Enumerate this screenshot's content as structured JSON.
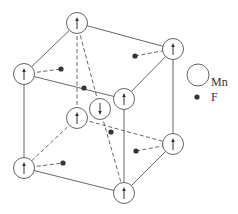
{
  "diagram": {
    "legend": [
      {
        "symbol": "open-circle",
        "label": "Mn"
      },
      {
        "symbol": "filled-dot",
        "label": "F"
      }
    ],
    "mn_atoms": [
      {
        "id": "top-back",
        "x": 77,
        "y": 23,
        "spin": "up"
      },
      {
        "id": "right-back-top",
        "x": 173,
        "y": 49,
        "spin": "up"
      },
      {
        "id": "left-top",
        "x": 24,
        "y": 74,
        "spin": "up"
      },
      {
        "id": "front-top",
        "x": 124,
        "y": 99,
        "spin": "up"
      },
      {
        "id": "back-bottom",
        "x": 77,
        "y": 118,
        "spin": "up"
      },
      {
        "id": "body-center",
        "x": 100,
        "y": 109,
        "spin": "down"
      },
      {
        "id": "right-back-bottom",
        "x": 173,
        "y": 144,
        "spin": "up"
      },
      {
        "id": "left-bottom",
        "x": 24,
        "y": 168,
        "spin": "up"
      },
      {
        "id": "front-bottom",
        "x": 124,
        "y": 193,
        "spin": "up"
      }
    ],
    "f_atoms": [
      {
        "x": 61,
        "y": 69
      },
      {
        "x": 135,
        "y": 56
      },
      {
        "x": 84,
        "y": 88
      },
      {
        "x": 111,
        "y": 132
      },
      {
        "x": 136,
        "y": 151
      },
      {
        "x": 63,
        "y": 163
      }
    ]
  }
}
